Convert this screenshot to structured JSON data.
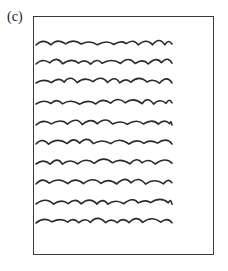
{
  "figure": {
    "label": "(c)",
    "stroke_color": "#2a2a2a",
    "page_border_color": "#3a3a3a",
    "text_lines": {
      "count": 10,
      "y_positions": [
        44,
        63,
        82,
        103,
        124,
        143,
        163,
        183,
        203,
        222
      ],
      "x_start": 36,
      "x_end": 172
    }
  }
}
